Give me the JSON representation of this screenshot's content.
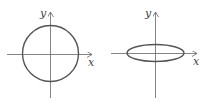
{
  "figures": [
    {
      "id": "circle",
      "shape": "circle",
      "x_label": "x",
      "y_label": "y"
    },
    {
      "id": "ellipse",
      "shape": "flattened ellipse",
      "x_label": "x",
      "y_label": "y"
    }
  ],
  "colors": {
    "axis": "#666666",
    "curve": "#555555",
    "text": "#444444"
  }
}
